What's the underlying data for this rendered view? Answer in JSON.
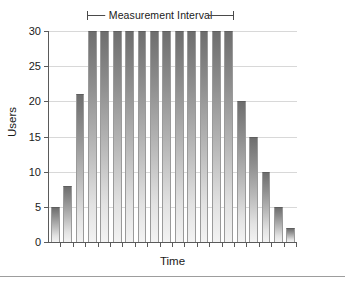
{
  "chart_data": {
    "type": "bar",
    "title": "",
    "xlabel": "Time",
    "ylabel": "Users",
    "ylim": [
      0,
      30
    ],
    "ytick_labels": [
      "0",
      "5",
      "10",
      "15",
      "20",
      "25",
      "30"
    ],
    "ytick_values": [
      0,
      5,
      10,
      15,
      20,
      25,
      30
    ],
    "xtick_labels": [],
    "grid": true,
    "legend": false,
    "categories": [
      "1",
      "2",
      "3",
      "4",
      "5",
      "6",
      "7",
      "8",
      "9",
      "10",
      "11",
      "12",
      "13",
      "14",
      "15",
      "16",
      "17",
      "18",
      "19",
      "20"
    ],
    "values": [
      5,
      8,
      21,
      30,
      30,
      30,
      30,
      30,
      30,
      30,
      30,
      30,
      30,
      30,
      30,
      20,
      15,
      10,
      5,
      2
    ],
    "annotations": [
      {
        "name": "measurement-interval",
        "text": "Measurement Interval",
        "style": "dimension-bracket",
        "spans_bar_indices": [
          3,
          14
        ]
      }
    ],
    "bar_fill": "gradient-gray-top-dark-to-bottom-light",
    "bar_color_top": "#6e6e6e",
    "bar_color_bottom": "#f3f3f3",
    "axis_color": "#5a5a5a",
    "grid_color": "#d8d8d8"
  },
  "annotation": {
    "interval_label": "Measurement Interval"
  },
  "axes": {
    "y_title": "Users",
    "x_title": "Time"
  }
}
